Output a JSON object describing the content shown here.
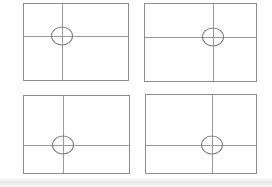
{
  "diagram": {
    "kind": "composition-grid-diagram",
    "canvas": {
      "width": 272,
      "height": 187
    },
    "colors": {
      "background": "#ffffff",
      "frame_border": "#8c8c8c",
      "gridline": "#9a9a9a",
      "circle_stroke": "#7d7d7d",
      "page_edge_shadow": "#e8e8e8"
    },
    "circle": {
      "width": 22,
      "height": 19
    },
    "frames": [
      {
        "id": "top-left",
        "x": 23,
        "y": 3,
        "w": 106,
        "h": 78,
        "vline_pct": 37,
        "hline_pct": 42
      },
      {
        "id": "top-right",
        "x": 144,
        "y": 3,
        "w": 113,
        "h": 79,
        "vline_pct": 61,
        "hline_pct": 43
      },
      {
        "id": "bottom-left",
        "x": 23,
        "y": 95,
        "w": 107,
        "h": 79,
        "vline_pct": 37,
        "hline_pct": 63
      },
      {
        "id": "bottom-right",
        "x": 145,
        "y": 94,
        "w": 112,
        "h": 80,
        "vline_pct": 60,
        "hline_pct": 64
      }
    ]
  }
}
